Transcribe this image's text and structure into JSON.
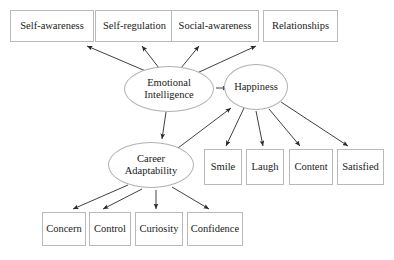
{
  "diagram": {
    "type": "path-model",
    "style": {
      "background": "#ffffff",
      "box_border": "#b9b9b9",
      "ellipse_border": "#b0b0b0",
      "edge_color": "#2a2a2a",
      "text_color": "#1a1a1a"
    },
    "latent_nodes": [
      {
        "id": "emotional-intelligence",
        "label_line1": "Emotional",
        "label_line2": "Intelligence",
        "shape": "ellipse",
        "x": 124,
        "y": 66,
        "w": 90,
        "h": 46
      },
      {
        "id": "happiness",
        "label_line1": "Happiness",
        "label_line2": "",
        "shape": "ellipse",
        "x": 224,
        "y": 64,
        "w": 64,
        "h": 46
      },
      {
        "id": "career-adaptability",
        "label_line1": "Career",
        "label_line2": "Adaptability",
        "shape": "ellipse",
        "x": 108,
        "y": 142,
        "w": 86,
        "h": 46
      }
    ],
    "top_indicators": [
      {
        "id": "self-awareness",
        "label": "Self-awareness",
        "x": 10,
        "y": 10,
        "w": 84,
        "h": 32
      },
      {
        "id": "self-regulation",
        "label": "Self-regulation",
        "x": 95,
        "y": 10,
        "w": 79,
        "h": 32
      },
      {
        "id": "social-awareness",
        "label": "Social-awareness",
        "x": 171,
        "y": 10,
        "w": 88,
        "h": 32
      },
      {
        "id": "relationships",
        "label": "Relationships",
        "x": 263,
        "y": 10,
        "w": 75,
        "h": 32
      }
    ],
    "happiness_indicators": [
      {
        "id": "smile",
        "label": "Smile",
        "x": 204,
        "y": 149,
        "w": 38,
        "h": 36
      },
      {
        "id": "laugh",
        "label": "Laugh",
        "x": 246,
        "y": 149,
        "w": 38,
        "h": 36
      },
      {
        "id": "content",
        "label": "Content",
        "x": 289,
        "y": 149,
        "w": 44,
        "h": 36
      },
      {
        "id": "satisfied",
        "label": "Satisfied",
        "x": 337,
        "y": 149,
        "w": 47,
        "h": 36
      }
    ],
    "career_indicators": [
      {
        "id": "concern",
        "label": "Concern",
        "x": 42,
        "y": 212,
        "w": 44,
        "h": 34
      },
      {
        "id": "control",
        "label": "Control",
        "x": 89,
        "y": 212,
        "w": 42,
        "h": 34
      },
      {
        "id": "curiosity",
        "label": "Curiosity",
        "x": 135,
        "y": 212,
        "w": 48,
        "h": 34
      },
      {
        "id": "confidence",
        "label": "Confidence",
        "x": 187,
        "y": 212,
        "w": 56,
        "h": 34
      }
    ],
    "edges": [
      {
        "id": "ei-to-self-awareness",
        "from": "emotional-intelligence",
        "to": "self-awareness",
        "x1": 148,
        "y1": 72,
        "x2": 87,
        "y2": 46
      },
      {
        "id": "ei-to-self-regulation",
        "from": "emotional-intelligence",
        "to": "self-regulation",
        "x1": 159,
        "y1": 68,
        "x2": 142,
        "y2": 46
      },
      {
        "id": "ei-to-social-awareness",
        "from": "emotional-intelligence",
        "to": "social-awareness",
        "x1": 181,
        "y1": 68,
        "x2": 199,
        "y2": 46
      },
      {
        "id": "ei-to-relationships",
        "from": "emotional-intelligence",
        "to": "relationships",
        "x1": 197,
        "y1": 73,
        "x2": 256,
        "y2": 46
      },
      {
        "id": "ei-to-happiness",
        "from": "emotional-intelligence",
        "to": "happiness",
        "x1": 216,
        "y1": 88,
        "x2": 228,
        "y2": 88
      },
      {
        "id": "ei-to-career-adaptability",
        "from": "emotional-intelligence",
        "to": "career-adaptability",
        "x1": 166,
        "y1": 112,
        "x2": 162,
        "y2": 139
      },
      {
        "id": "career-to-happiness",
        "from": "career-adaptability",
        "to": "happiness",
        "x1": 178,
        "y1": 148,
        "x2": 231,
        "y2": 108
      },
      {
        "id": "happiness-to-smile",
        "from": "happiness",
        "to": "smile",
        "x1": 244,
        "y1": 108,
        "x2": 226,
        "y2": 146
      },
      {
        "id": "happiness-to-laugh",
        "from": "happiness",
        "to": "laugh",
        "x1": 256,
        "y1": 111,
        "x2": 263,
        "y2": 146
      },
      {
        "id": "happiness-to-content",
        "from": "happiness",
        "to": "content",
        "x1": 269,
        "y1": 109,
        "x2": 300,
        "y2": 146
      },
      {
        "id": "happiness-to-satisfied",
        "from": "happiness",
        "to": "satisfied",
        "x1": 281,
        "y1": 102,
        "x2": 348,
        "y2": 146
      },
      {
        "id": "career-to-concern",
        "from": "career-adaptability",
        "to": "concern",
        "x1": 128,
        "y1": 185,
        "x2": 73,
        "y2": 209
      },
      {
        "id": "career-to-control",
        "from": "career-adaptability",
        "to": "control",
        "x1": 142,
        "y1": 189,
        "x2": 103,
        "y2": 209
      },
      {
        "id": "career-to-curiosity",
        "from": "career-adaptability",
        "to": "curiosity",
        "x1": 156,
        "y1": 190,
        "x2": 156,
        "y2": 209
      },
      {
        "id": "career-to-confidence",
        "from": "career-adaptability",
        "to": "confidence",
        "x1": 172,
        "y1": 187,
        "x2": 209,
        "y2": 209
      }
    ]
  }
}
